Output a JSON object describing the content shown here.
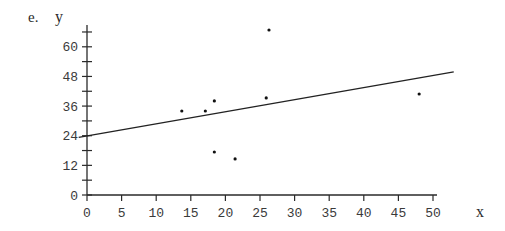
{
  "panel_label": "e.",
  "chart_data": {
    "type": "scatter",
    "title": "",
    "xlabel": "x",
    "ylabel": "y",
    "xlim": [
      0,
      52
    ],
    "ylim": [
      0,
      66
    ],
    "grid": false,
    "legend": null,
    "x_ticks": [
      0,
      5,
      10,
      15,
      20,
      25,
      30,
      35,
      40,
      45,
      50
    ],
    "y_ticks_labeled": [
      0,
      12,
      24,
      36,
      48,
      60
    ],
    "y_ticks_minor": [
      6,
      18,
      30,
      42,
      54,
      66
    ],
    "points": [
      {
        "x": 13.7,
        "y": 34.0
      },
      {
        "x": 17.1,
        "y": 34.0
      },
      {
        "x": 18.4,
        "y": 38.1
      },
      {
        "x": 18.4,
        "y": 17.4
      },
      {
        "x": 21.4,
        "y": 14.6
      },
      {
        "x": 25.9,
        "y": 39.3
      },
      {
        "x": 26.3,
        "y": 66.8
      },
      {
        "x": 48.0,
        "y": 40.9
      }
    ],
    "fit_line": {
      "intercept": 23.9,
      "slope": 0.49,
      "x_start": -1.2,
      "x_end": 53.0
    }
  },
  "layout": {
    "origin_px": [
      87,
      195
    ],
    "px_per_x": 6.92,
    "px_per_y": 2.47,
    "x_axis_end_px": 437,
    "y_axis_top_px": 25,
    "colors": {
      "ink": "#2a2a2a",
      "background": "#ffffff"
    }
  }
}
